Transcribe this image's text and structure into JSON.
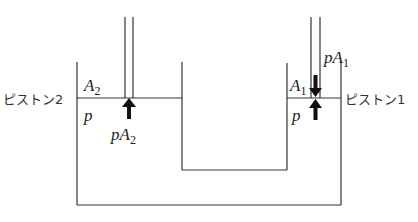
{
  "diagram": {
    "type": "hydraulic-press",
    "labels": {
      "piston_left": "ピストン2",
      "piston_right": "ピストン1",
      "area_left": {
        "main": "A",
        "sub": "2"
      },
      "area_right": {
        "main": "A",
        "sub": "1"
      },
      "pressure_left": "p",
      "pressure_right": "p",
      "force_left": {
        "main": "pA",
        "sub": "2"
      },
      "force_right": {
        "main": "pA",
        "sub": "1"
      }
    },
    "colors": {
      "line": "#333333",
      "arrow": "#111111",
      "background": "#ffffff"
    }
  }
}
